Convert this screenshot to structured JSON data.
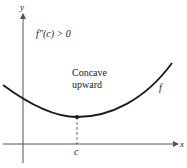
{
  "figure": {
    "condition_label": "f″(c) > 0",
    "annotation_line1": "Concave",
    "annotation_line2": "upward",
    "curve_label": "f",
    "x_axis_label": "x",
    "y_axis_label": "y",
    "point_label": "c",
    "colors": {
      "curve": "#1a1a1a",
      "axis": "#555555",
      "dashed": "#444444"
    }
  }
}
